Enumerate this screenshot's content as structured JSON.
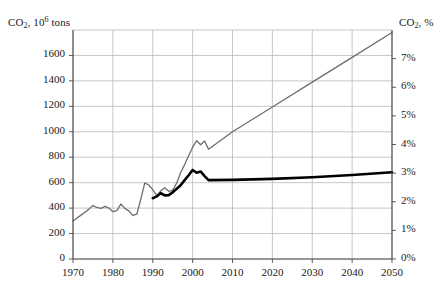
{
  "chart_data": {
    "type": "line",
    "title": "",
    "xlabel": "",
    "ylabel": "CO2, 10^6 tons",
    "ylabel_right": "CO2, %",
    "xlim": [
      1970,
      2050
    ],
    "ylim": [
      0,
      1800
    ],
    "ylim_right": [
      0,
      8
    ],
    "grid": true,
    "legend": "none",
    "left_axis_title_main": "CO",
    "left_axis_title_sub": "2",
    "left_axis_title_rest": ", 10",
    "left_axis_title_sup": "6",
    "left_axis_title_tail": " tons",
    "right_axis_title_main": "CO",
    "right_axis_title_sub": "2",
    "right_axis_title_tail": ", %",
    "y_ticks_left": [
      "0",
      "200",
      "400",
      "600",
      "800",
      "1000",
      "1200",
      "1400",
      "1600"
    ],
    "y_tick_values_left": [
      0,
      200,
      400,
      600,
      800,
      1000,
      1200,
      1400,
      1600
    ],
    "y_ticks_right": [
      "0%",
      "1%",
      "2%",
      "3%",
      "4%",
      "5%",
      "6%",
      "7%"
    ],
    "y_tick_values_right": [
      0,
      1,
      2,
      3,
      4,
      5,
      6,
      7
    ],
    "x_ticks": [
      "1970",
      "1980",
      "1990",
      "2000",
      "2010",
      "2020",
      "2030",
      "2040",
      "2050"
    ],
    "x_tick_values": [
      1970,
      1980,
      1990,
      2000,
      2010,
      2020,
      2030,
      2040,
      2050
    ],
    "colors": {
      "series_total": "#6e6e6e",
      "series_share": "#000000",
      "grid": "#b9b9b9",
      "axis": "#4a4a4a"
    },
    "series": [
      {
        "name": "CO2 emissions, 10^6 tons",
        "axis": "left",
        "color": "#6e6e6e",
        "width": 1.3,
        "x": [
          1970,
          1971,
          1972,
          1973,
          1974,
          1975,
          1976,
          1977,
          1978,
          1979,
          1980,
          1981,
          1982,
          1983,
          1984,
          1985,
          1986,
          1987,
          1988,
          1989,
          1990,
          1991,
          1992,
          1993,
          1994,
          1995,
          1996,
          1997,
          1998,
          1999,
          2000,
          2001,
          2002,
          2003,
          2004,
          2010,
          2020,
          2030,
          2040,
          2050
        ],
        "values": [
          298,
          322,
          345,
          368,
          392,
          420,
          405,
          398,
          414,
          400,
          372,
          380,
          432,
          398,
          378,
          342,
          352,
          470,
          598,
          582,
          545,
          498,
          536,
          560,
          532,
          542,
          596,
          680,
          742,
          812,
          878,
          930,
          898,
          928,
          862,
          1000,
          1195,
          1390,
          1585,
          1780
        ]
      },
      {
        "name": "CO2 share, %",
        "axis": "left",
        "color": "#000000",
        "width": 2.6,
        "x": [
          1990,
          1991,
          1992,
          1993,
          1994,
          1995,
          1996,
          1997,
          1998,
          1999,
          2000,
          2001,
          2002,
          2003,
          2004,
          2010,
          2020,
          2030,
          2040,
          2050
        ],
        "values": [
          478,
          492,
          518,
          500,
          502,
          524,
          552,
          580,
          620,
          658,
          700,
          678,
          688,
          652,
          620,
          622,
          630,
          642,
          660,
          682
        ]
      }
    ],
    "annotations": [
      {
        "text": "gray line = absolute CO2 emissions, left axis"
      },
      {
        "text": "black line = CO2 share in percent, right axis"
      }
    ]
  }
}
